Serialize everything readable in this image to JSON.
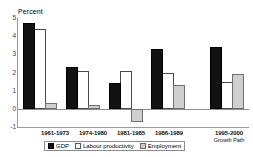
{
  "chart_data": {
    "type": "bar",
    "title": "",
    "ylabel": "Percent",
    "xlabel": "",
    "ylim": [
      -1,
      5
    ],
    "yticks": [
      "5",
      "4",
      "3",
      "2",
      "1",
      "0",
      "-1"
    ],
    "grid": false,
    "legend_position": "bottom",
    "categories": [
      "1961-1973",
      "1974-1980",
      "1981-1985",
      "1986-1989",
      "1995-2000"
    ],
    "category_sublabels": [
      "",
      "",
      "",
      "",
      "Growth Path"
    ],
    "series": [
      {
        "name": "GDP",
        "color": "#121212",
        "values": [
          4.7,
          2.3,
          1.4,
          3.3,
          3.4
        ]
      },
      {
        "name": "Labour productivity",
        "color": "#ffffff",
        "values": [
          4.4,
          2.1,
          2.1,
          2.0,
          1.5
        ]
      },
      {
        "name": "Employment",
        "color": "#cfcfcf",
        "values": [
          0.3,
          0.2,
          -0.7,
          1.3,
          1.9
        ]
      }
    ]
  },
  "axis": {
    "y_title": "Percent",
    "ticks": [
      {
        "label": "5",
        "value": 5
      },
      {
        "label": "4",
        "value": 4
      },
      {
        "label": "3",
        "value": 3
      },
      {
        "label": "2",
        "value": 2
      },
      {
        "label": "1",
        "value": 1
      },
      {
        "label": "0",
        "value": 0
      },
      {
        "label": "-1",
        "value": -1
      }
    ]
  },
  "xlabels": [
    {
      "main": "1961-1973",
      "sub": ""
    },
    {
      "main": "1974-1980",
      "sub": ""
    },
    {
      "main": "1981-1985",
      "sub": ""
    },
    {
      "main": "1986-1989",
      "sub": ""
    },
    {
      "main": "1995-2000",
      "sub": "Growth Path"
    }
  ],
  "legend": {
    "items": [
      {
        "label": "GDP",
        "swatch": "gdp"
      },
      {
        "label": "Labour productivity",
        "swatch": "prod"
      },
      {
        "label": "Employment",
        "swatch": "emp"
      }
    ]
  }
}
